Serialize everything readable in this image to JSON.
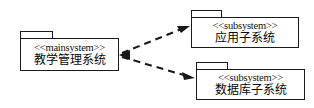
{
  "diagram": {
    "type": "uml-package-diagram",
    "background_color": "#ffffff",
    "line_color": "#1a1a1a",
    "packages": [
      {
        "id": "main",
        "stereotype": "<<mainsystem>>",
        "name": "教学管理系统"
      },
      {
        "id": "app",
        "stereotype": "<<subsystem>>",
        "name": "应用子系统"
      },
      {
        "id": "db",
        "stereotype": "<<subsystem>>",
        "name": "数据库子系统"
      }
    ],
    "dependencies": [
      {
        "id": "dep-main-app",
        "from": "main",
        "to": "app",
        "style": "dashed",
        "arrowhead": "filled"
      },
      {
        "id": "dep-main-db",
        "from": "main",
        "to": "db",
        "style": "dashed",
        "arrowhead": "filled"
      }
    ]
  }
}
